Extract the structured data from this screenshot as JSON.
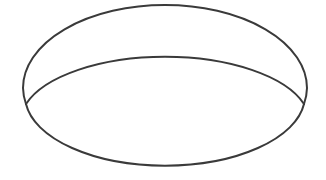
{
  "diagram": {
    "stroke_color": "#3a3a3a",
    "background_color": "#ffffff",
    "stroke_width": 2,
    "shapes": [
      {
        "name": "outer-rim-arc",
        "type": "elliptical-arc"
      },
      {
        "name": "inner-back-arc",
        "type": "elliptical-arc"
      },
      {
        "name": "front-bottom-arc",
        "type": "elliptical-arc"
      }
    ]
  }
}
